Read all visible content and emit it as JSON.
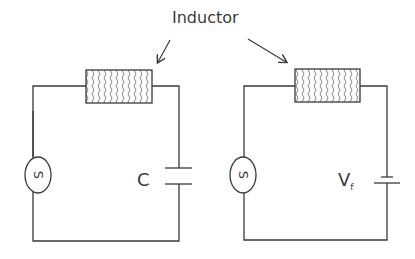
{
  "diagram": {
    "title_label": "Inductor",
    "left_circuit": {
      "source_label": "S",
      "component": "capacitor",
      "component_label": "C",
      "inductor": "inductor"
    },
    "right_circuit": {
      "source_label": "S",
      "component": "battery",
      "component_label_main": "V",
      "component_label_sub": "f",
      "inductor": "inductor"
    },
    "colors": {
      "line": "#3a3a3a",
      "background": "#ffffff"
    }
  }
}
